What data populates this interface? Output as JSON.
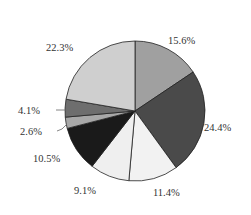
{
  "chart_data": {
    "type": "pie",
    "title": "",
    "start_angle_deg": 0,
    "direction": "clockwise",
    "legend": null,
    "slices": [
      {
        "label": "15.6%",
        "value": 15.6,
        "color": "#a0a0a0"
      },
      {
        "label": "24.4%",
        "value": 24.4,
        "color": "#4a4a4a"
      },
      {
        "label": "11.4%",
        "value": 11.4,
        "color": "#f2f2f2"
      },
      {
        "label": "9.1%",
        "value": 9.1,
        "color": "#efefef"
      },
      {
        "label": "10.5%",
        "value": 10.5,
        "color": "#1a1a1a"
      },
      {
        "label": "2.6%",
        "value": 2.6,
        "color": "#a8a8a8"
      },
      {
        "label": "4.1%",
        "value": 4.1,
        "color": "#6e6e6e"
      },
      {
        "label": "22.3%",
        "value": 22.3,
        "color": "#cfcfcf"
      }
    ],
    "label_positions": [
      {
        "x": 168,
        "y": 44
      },
      {
        "x": 204,
        "y": 131
      },
      {
        "x": 153,
        "y": 196
      },
      {
        "x": 74,
        "y": 194
      },
      {
        "x": 33,
        "y": 162
      },
      {
        "x": 20,
        "y": 135
      },
      {
        "x": 18,
        "y": 114
      },
      {
        "x": 46,
        "y": 51
      }
    ],
    "leader_lines": [
      {
        "slice": "4.1%",
        "points": [
          [
            56,
            110
          ],
          [
            66,
            110
          ]
        ]
      },
      {
        "slice": "2.6%",
        "points": [
          [
            57,
            131
          ],
          [
            62,
            129
          ],
          [
            67,
            124
          ]
        ]
      }
    ],
    "center": {
      "x": 135,
      "y": 111
    },
    "radius": 70
  }
}
